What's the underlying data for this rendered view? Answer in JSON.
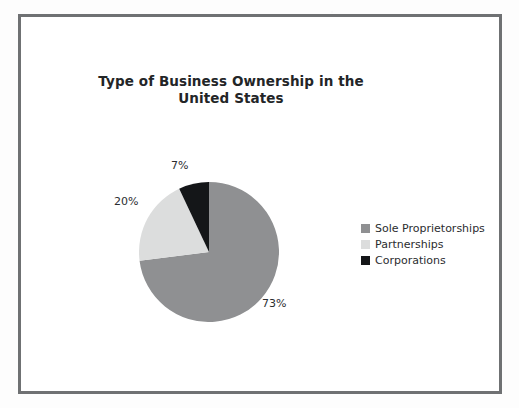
{
  "chart_data": {
    "type": "pie",
    "title": "Type of Business Ownership in the United States",
    "categories": [
      "Sole Proprietorships",
      "Partnerships",
      "Corporations"
    ],
    "values": [
      73,
      20,
      7
    ],
    "data_labels": [
      "73%",
      "20%",
      "7%"
    ],
    "colors": [
      "#8f9092",
      "#dcdddd",
      "#141618"
    ],
    "legend_position": "right",
    "grid": false,
    "xlabel": "",
    "ylabel": "",
    "start_angle_deg": 0,
    "direction": "clockwise"
  },
  "figure": {
    "title": "Type of Business Ownership in the United States",
    "frame_color": "#6f7173",
    "background": "#ffffff"
  },
  "labels": {
    "corporations_pct": "7%",
    "partnerships_pct": "20%",
    "sole_pct": "73%"
  },
  "legend": {
    "items": [
      {
        "label": "Sole Proprietorships",
        "color": "#8f9092"
      },
      {
        "label": "Partnerships",
        "color": "#dcdddd"
      },
      {
        "label": "Corporations",
        "color": "#141618"
      }
    ]
  }
}
